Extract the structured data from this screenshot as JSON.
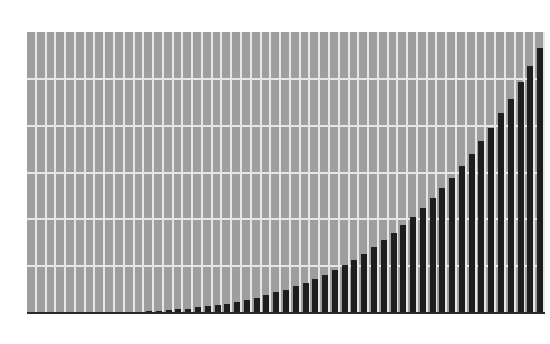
{
  "chart_data": {
    "type": "bar",
    "title": "",
    "xlabel": "",
    "ylabel": "",
    "ylim": [
      0,
      6
    ],
    "grid": true,
    "legend": null,
    "categories": [
      1,
      2,
      3,
      4,
      5,
      6,
      7,
      8,
      9,
      10,
      11,
      12,
      13,
      14,
      15,
      16,
      17,
      18,
      19,
      20,
      21,
      22,
      23,
      24,
      25,
      26,
      27,
      28,
      29,
      30,
      31,
      32,
      33,
      34,
      35,
      36,
      37,
      38,
      39,
      40,
      41,
      42,
      43,
      44,
      45,
      46,
      47,
      48,
      49,
      50,
      51,
      52,
      53
    ],
    "values": [
      0.0,
      0.0,
      0.0,
      0.0,
      0.0,
      0.0,
      0.0,
      0.01,
      0.01,
      0.01,
      0.02,
      0.03,
      0.04,
      0.05,
      0.06,
      0.08,
      0.09,
      0.12,
      0.14,
      0.17,
      0.2,
      0.24,
      0.28,
      0.33,
      0.38,
      0.44,
      0.5,
      0.57,
      0.64,
      0.73,
      0.82,
      0.92,
      1.03,
      1.14,
      1.27,
      1.41,
      1.56,
      1.71,
      1.88,
      2.06,
      2.25,
      2.45,
      2.66,
      2.89,
      3.14,
      3.4,
      3.67,
      3.96,
      4.27,
      4.58,
      4.93,
      5.28,
      5.65
    ],
    "colors": {
      "background": "#9e9e9e",
      "bar": "#1e1e1e",
      "grid": "#e6e6e6"
    }
  }
}
